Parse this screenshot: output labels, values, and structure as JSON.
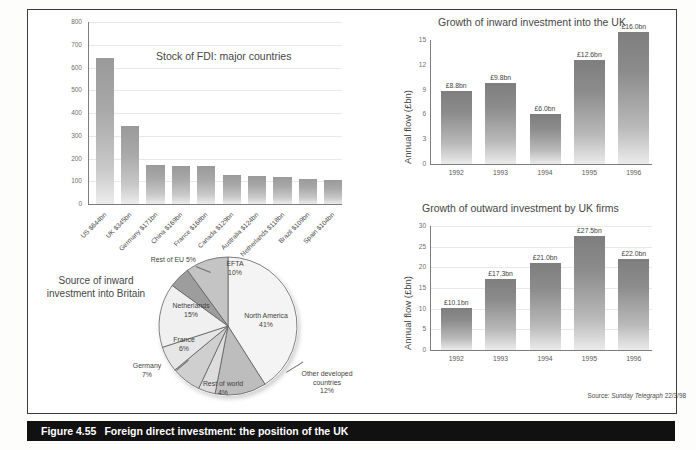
{
  "figure": {
    "number": "Figure 4.55",
    "title": "Foreign direct investment: the position of the UK",
    "source_note_prefix": "Source: ",
    "source_note_italic": "Sunday Telegraph",
    "source_note_suffix": " 22/3/98"
  },
  "chart_data": [
    {
      "type": "bar",
      "id": "stock-of-fdi",
      "title": "Stock of FDI: major countries",
      "xlabel": "",
      "ylabel": "",
      "ylim": [
        0,
        800
      ],
      "yticks": [
        "0",
        "100",
        "200",
        "300",
        "400",
        "500",
        "600",
        "700",
        "800"
      ],
      "grid": true,
      "categories": [
        "US $644bn",
        "UK $345bn",
        "Germany $171bn",
        "China $169bn",
        "France $168bn",
        "Canada $129bn",
        "Australia $124bn",
        "Netherlands $118bn",
        "Brazil $109bn",
        "Spain $104bn"
      ],
      "values": [
        644,
        345,
        171,
        169,
        168,
        129,
        124,
        118,
        109,
        104
      ]
    },
    {
      "type": "pie",
      "id": "source-of-inward-investment",
      "title": "Source of inward investment into Britain",
      "labels": [
        "North America",
        "Other developed countries",
        "Rest of world",
        "Germany",
        "France",
        "Netherlands",
        "Rest of EU",
        "EFTA"
      ],
      "values": [
        41,
        12,
        4,
        7,
        6,
        15,
        5,
        10
      ],
      "value_labels": [
        "41%",
        "12%",
        "4%",
        "7%",
        "6%",
        "15%",
        "5%",
        "10%"
      ]
    },
    {
      "type": "bar",
      "id": "inward-investment",
      "title": "Growth of inward investment into the UK",
      "xlabel": "",
      "ylabel": "Annual flow (£bn)",
      "ylim": [
        0,
        15
      ],
      "yticks": [
        "0",
        "3",
        "6",
        "9",
        "12",
        "15"
      ],
      "grid": false,
      "categories": [
        "1992",
        "1993",
        "1994",
        "1995",
        "1996"
      ],
      "values": [
        8.8,
        9.8,
        6.0,
        12.6,
        16.0
      ],
      "data_labels": [
        "£8.8bn",
        "£9.8bn",
        "£6.0bn",
        "£12.6bn",
        "£16.0bn"
      ]
    },
    {
      "type": "bar",
      "id": "outward-investment",
      "title": "Growth of outward investment by UK firms",
      "xlabel": "",
      "ylabel": "Annual flow (£bn)",
      "ylim": [
        0,
        30
      ],
      "yticks": [
        "0",
        "5",
        "10",
        "15",
        "20",
        "25",
        "30"
      ],
      "grid": true,
      "categories": [
        "1992",
        "1993",
        "1994",
        "1995",
        "1996"
      ],
      "values": [
        10.1,
        17.3,
        21.0,
        27.5,
        22.0
      ],
      "data_labels": [
        "£10.1bn",
        "£17.3bn",
        "£21.0bn",
        "£27.5bn",
        "£22.0bn"
      ]
    }
  ],
  "colors": {
    "bar_top": "#9a9a9a",
    "bar_bottom": "#ececec",
    "caption_bar": "#111111",
    "frame_border": "#3b3b3b",
    "gridline": "#e8e8e8"
  }
}
